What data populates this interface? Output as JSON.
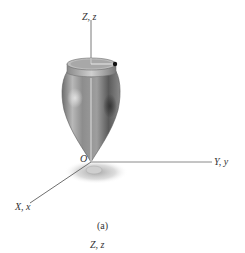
{
  "figure": {
    "axes": {
      "z_label": "Z, z",
      "y_label": "Y, y",
      "x_label": "X, x",
      "origin_label": "O"
    },
    "caption": "(a)",
    "next_figure_axis_label": "Z, z",
    "colors": {
      "axis_line": "#777777",
      "vessel_light": "#d9d9d9",
      "vessel_mid": "#9a9a9a",
      "vessel_dark": "#4a4a4a",
      "shadow": "#b0b0b0",
      "marker": "#111111"
    }
  }
}
